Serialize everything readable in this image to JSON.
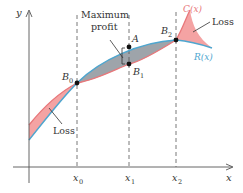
{
  "diagram": {
    "axes": {
      "x_label": "x",
      "y_label": "y"
    },
    "x_ticks": [
      {
        "label": "x",
        "sub": "0"
      },
      {
        "label": "x",
        "sub": "1"
      },
      {
        "label": "x",
        "sub": "2"
      }
    ],
    "curves": {
      "cost": {
        "label": "C(x)",
        "color": "#e8777a"
      },
      "revenue": {
        "label": "R(x)",
        "color": "#4ea6cf"
      }
    },
    "points": {
      "B0": {
        "label": "B",
        "sub": "0"
      },
      "B1": {
        "label": "B",
        "sub": "1"
      },
      "B2": {
        "label": "B",
        "sub": "2"
      },
      "A": {
        "label": "A"
      }
    },
    "regions": {
      "loss_left": {
        "label": "Loss",
        "color": "#f4a3a3"
      },
      "profit": {
        "label_line1": "Maximum",
        "label_line2": "profit",
        "color": "#9ea4aa"
      },
      "loss_right": {
        "label": "Loss",
        "color": "#f4a3a3"
      }
    }
  }
}
